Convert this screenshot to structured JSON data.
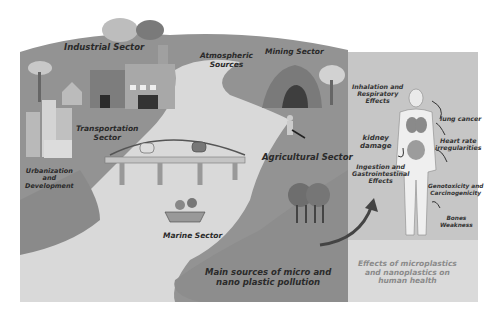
{
  "left_panel": {
    "title": "Main sources of micro and nano plastic pollution",
    "title_lines": [
      "Main sources of micro and",
      "nano plastic pollution"
    ],
    "sectors": {
      "industrial": "Industrial Sector",
      "atmospheric": [
        "Atmospheric",
        "Sources"
      ],
      "mining": "Mining Sector",
      "transportation": [
        "Transportation",
        "Sector"
      ],
      "urbanization": [
        "Urbanization",
        "and",
        "Development"
      ],
      "agricultural": "Agricultural Sector",
      "marine": "Marine Sector"
    }
  },
  "right_panel": {
    "title_lines": [
      "Effects of microplastics",
      "and nanoplastics on",
      "human health"
    ],
    "effects": {
      "inhalation": [
        "Inhalation and",
        "Respiratory",
        "Effects"
      ],
      "lung": "lung cancer",
      "kidney": [
        "kidney",
        "damage"
      ],
      "heart": [
        "Heart rate",
        "irregularities"
      ],
      "ingestion": [
        "Ingestion and",
        "Gastrointestinal",
        "Effects"
      ],
      "genotoxicity": [
        "Genotoxicity and",
        "Carcinogenicity"
      ],
      "bones": [
        "Bones",
        "Weakness"
      ]
    }
  },
  "colors": {
    "land_dark": "#8c8c8c",
    "land_mid": "#9a9a9a",
    "river": "#dcdcdc",
    "right_panel": "#c4c4c4",
    "right_panel_bottom": "#e6e6e6",
    "text": "#2a2a2a"
  }
}
